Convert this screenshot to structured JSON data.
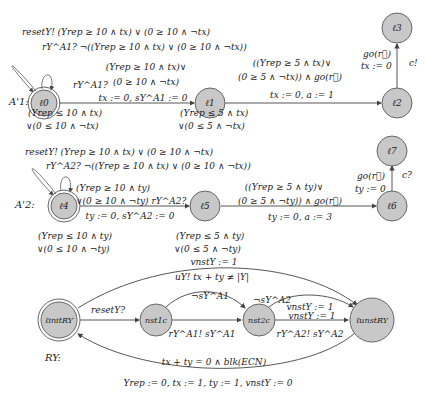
{
  "automata": [
    {
      "name": "A'1:",
      "locations": [
        {
          "id": "l0",
          "label": "ℓ0",
          "initial": true
        },
        {
          "id": "l1",
          "label": "ℓ1"
        },
        {
          "id": "l2",
          "label": "ℓ2"
        },
        {
          "id": "l3",
          "label": "ℓ3"
        }
      ],
      "self_loops": {
        "line1": "resetY! (Yrep ≥ 10 ∧ tx) ∨ (0 ≥ 10  ∧  ¬tx)",
        "line2": "rY^A1? ¬((Yrep ≥ 10 ∧ tx) ∨ (0 ≥ 10  ∧  ¬tx))"
      },
      "edge_l0_l1": {
        "sync": "rY^A1?",
        "guard1": "(Yrep ≥ 10 ∧ tx)∨",
        "guard2": "(0 ≥ 10  ∧  ¬tx)",
        "update": "tx := 0, sY^A1 := 0"
      },
      "invariant_l0": {
        "line1": "(Yrep ≤ 10 ∧ tx)",
        "line2": "∨(0 ≤ 10  ∧  ¬tx)"
      },
      "invariant_l1": {
        "line1": "(Yrep ≤ 5 ∧ tx)",
        "line2": "∨(0 ≤ 5  ∧  ¬tx)"
      },
      "edge_l1_l2": {
        "guard1": "((Yrep ≥ 5 ∧ tx)∨",
        "guard2": "(0 ≥ 5  ∧  ¬tx)) ∧ go(r⃗)",
        "update": "tx := 0, a := 1"
      },
      "edge_l2_l3": {
        "guard": "go(r⃗)",
        "update": "tx := 0",
        "sync": "c!"
      }
    },
    {
      "name": "A'2:",
      "locations": [
        {
          "id": "l4",
          "label": "ℓ4",
          "initial": true
        },
        {
          "id": "l5",
          "label": "ℓ5"
        },
        {
          "id": "l6",
          "label": "ℓ6"
        },
        {
          "id": "l7",
          "label": "ℓ7"
        }
      ],
      "self_loops": {
        "line1": "resetY! (Yrep ≥ 10 ∧ tx) ∨ (0 ≥ 10  ∧  ¬tx)",
        "line2": "rY^A2? ¬((Yrep ≥ 10 ∧ tx) ∨ (0 ≥ 10  ∧  ¬tx))"
      },
      "edge_l4_l5": {
        "guard1": "(Yrep ≥ 10 ∧ ty)",
        "guard2": "∨(0 ≥ 10  ∧  ¬ty) rY^A2?",
        "update": "ty := 0, sY^A2 := 0"
      },
      "invariant_l4": {
        "line1": "(Yrep ≤ 10 ∧ ty)",
        "line2": "∨(0 ≤ 10  ∧  ¬ty)"
      },
      "invariant_l5": {
        "line1": "(Yrep ≤ 5 ∧ ty)",
        "line2": "∨(0 ≤ 5  ∧  ¬ty)"
      },
      "edge_l5_l6": {
        "guard1": "((Yrep ≥ 5 ∧ ty)∨",
        "guard2": "(0 ≥ 5  ∧  ¬ty)) ∧ go(r⃗)",
        "update": "ty := 0, a := 3"
      },
      "edge_l6_l7": {
        "guard": "go(r⃗)",
        "update": "ty := 0",
        "sync": "c?"
      }
    },
    {
      "name": "RY:",
      "locations": [
        {
          "id": "linit",
          "label": "ℓinitRY",
          "initial": true
        },
        {
          "id": "nst1",
          "label": "nst1c"
        },
        {
          "id": "nst2",
          "label": "nst2c"
        },
        {
          "id": "lnst",
          "label": "ℓunstRY"
        }
      ],
      "edge_top": {
        "update": "vnstY := 1",
        "label": "uY!  tx + ty ≠ |Y|"
      },
      "edge_init_nst1": {
        "sync": "resetY?"
      },
      "edge_nst1_nst2_arc": {
        "guard": "¬sY^A1"
      },
      "edge_nst1_nst2": {
        "label": "rY^A1!  sY^A1"
      },
      "edge_nst2_lnst_arc": {
        "guard": "¬sY^A2",
        "update": "vnstY := 1"
      },
      "edge_nst2_lnst": {
        "update": "vnstY := 1",
        "label": "rY^A2!  sY^A2"
      },
      "edge_bottom": {
        "guard": "tx + ty = 0 ∧ blk(ECN)",
        "update": "Yrep := 0, tx := 1, ty := 1, vnstY := 0"
      }
    }
  ],
  "colors": {
    "node_fill": "#c8c8c8",
    "node_stroke": "#555555",
    "edge": "#444444",
    "text": "#222222"
  }
}
